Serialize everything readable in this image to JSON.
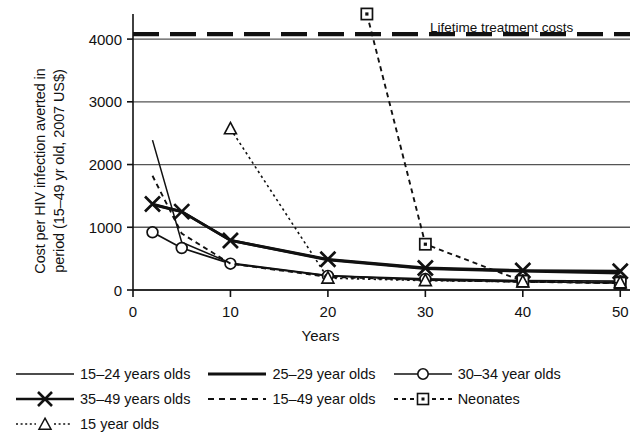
{
  "chart_data": {
    "type": "line",
    "title": "",
    "xlabel": "Years",
    "ylabel": "Cost per HIV infection averted in period (15–49 yr old, 2007 US$)",
    "ylabel_line1": "Cost per HIV infection averted in",
    "ylabel_line2": "period (15–49 yr old, 2007 US$)",
    "xlim": [
      0,
      51
    ],
    "ylim": [
      0,
      4400
    ],
    "xticks": [
      0,
      10,
      20,
      30,
      40,
      50
    ],
    "xtick_labels": [
      "0",
      "10",
      "20",
      "30",
      "40",
      "50"
    ],
    "yticks": [
      0,
      1000,
      2000,
      3000,
      4000
    ],
    "ytick_labels": [
      "0",
      "1000",
      "2000",
      "3000",
      "4000"
    ],
    "grid": "horizontal",
    "legend_position": "below",
    "annotations": [
      {
        "text": "Lifetime treatment costs",
        "value": 4080,
        "style": "dashed-thick-black"
      }
    ],
    "reference_line": {
      "label": "Lifetime treatment costs",
      "value": 4080
    },
    "series": [
      {
        "name": "15–24 years olds",
        "style": "thin-solid",
        "marker": "none",
        "x": [
          2,
          5,
          10,
          20,
          30,
          40,
          50
        ],
        "values": [
          2390,
          760,
          430,
          230,
          160,
          130,
          110
        ]
      },
      {
        "name": "25–29 year olds",
        "style": "thick-solid",
        "marker": "none",
        "x": [
          2,
          5,
          10,
          20,
          30,
          40,
          50
        ],
        "values": [
          1360,
          1250,
          790,
          480,
          340,
          300,
          270
        ]
      },
      {
        "name": "30–34 year olds",
        "style": "solid",
        "marker": "circle",
        "x": [
          2,
          5,
          10,
          20,
          30,
          40,
          50
        ],
        "values": [
          920,
          670,
          420,
          225,
          175,
          150,
          140
        ]
      },
      {
        "name": "35–49 years olds",
        "style": "thick-solid",
        "marker": "cross",
        "x": [
          2,
          5,
          10,
          20,
          30,
          40,
          50
        ],
        "values": [
          1370,
          1250,
          790,
          490,
          350,
          310,
          300
        ]
      },
      {
        "name": "15–49 year olds",
        "style": "dashed",
        "marker": "none",
        "x": [
          2,
          5,
          10,
          20,
          30,
          40,
          50
        ],
        "values": [
          1820,
          900,
          420,
          210,
          160,
          130,
          110
        ]
      },
      {
        "name": "Neonates",
        "style": "dashed",
        "marker": "square",
        "x": [
          24,
          30,
          40,
          50
        ],
        "values": [
          4400,
          730,
          140,
          110
        ]
      },
      {
        "name": "15 year olds",
        "style": "dotted",
        "marker": "triangle",
        "x": [
          10,
          20,
          30,
          40,
          50
        ],
        "values": [
          2570,
          190,
          150,
          130,
          115
        ]
      }
    ]
  },
  "legend": {
    "rows": [
      [
        {
          "label": "15–24 years olds",
          "swatch": "thin-line"
        },
        {
          "label": "25–29 year olds",
          "swatch": "thick-line"
        },
        {
          "label": "30–34 year olds",
          "swatch": "line-circle"
        }
      ],
      [
        {
          "label": "35–49 years olds",
          "swatch": "line-cross"
        },
        {
          "label": "15–49 year olds",
          "swatch": "dashed-line"
        },
        {
          "label": "Neonates",
          "swatch": "dashed-square"
        }
      ],
      [
        {
          "label": "15 year olds",
          "swatch": "dotted-triangle"
        }
      ]
    ]
  },
  "colors": {
    "ink": "#111111",
    "grid": "#555555",
    "background": "#ffffff"
  }
}
